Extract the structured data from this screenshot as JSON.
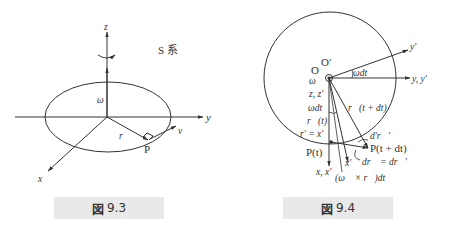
{
  "figures": [
    {
      "caption": {
        "icon": "図",
        "number": "9.3"
      },
      "labels": {
        "z": "z",
        "y": "y",
        "x": "x",
        "frame": "S 系",
        "omega": "ω⃗",
        "r": "r⃗",
        "v": "v⃗",
        "P": "P"
      }
    },
    {
      "caption": {
        "icon": "図",
        "number": "9.4"
      },
      "labels": {
        "O": "O",
        "Oprime": "O′",
        "omega": "ω",
        "zz": "z, z′",
        "omegadt_top": "ωdt",
        "omegadt_left": "ωdt",
        "r_t": "r⃗(t)",
        "r_tdt": "r⃗(t + dt)",
        "rprime_eq": "r′ = x′",
        "P_t": "P(t)",
        "P_tdt": "P(t + dt)",
        "yprime": "y′",
        "yy": "y, y′",
        "xx": "x, x′",
        "xprime": "x′",
        "cross": "(ω⃗ × r⃗)dt",
        "dprime_r": "d′r⃗′",
        "dr_eq": "dr⃗ = dr⃗′"
      }
    }
  ]
}
